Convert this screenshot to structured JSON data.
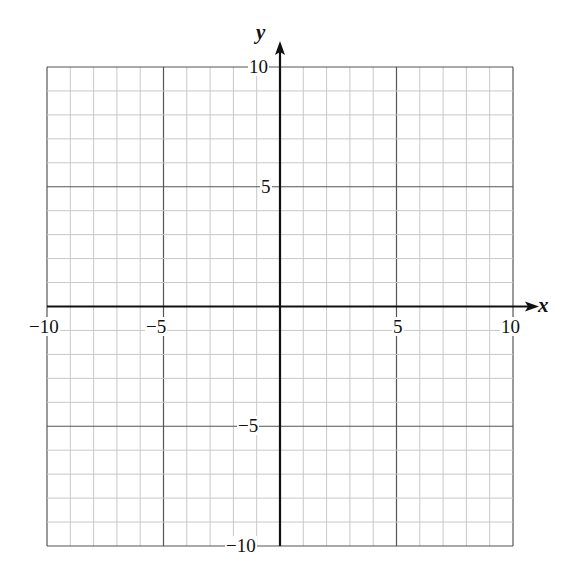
{
  "chart_data": {
    "type": "scatter",
    "title": "",
    "xlabel": "x",
    "ylabel": "y",
    "xlim": [
      -10,
      10
    ],
    "ylim": [
      -10,
      10
    ],
    "grid": true,
    "minor_grid_step": 1,
    "major_grid_step": 5,
    "x_ticks": [
      "−10",
      "−5",
      "5",
      "10"
    ],
    "y_ticks": [
      "10",
      "5",
      "−5",
      "−10"
    ],
    "series": [],
    "legend": null
  },
  "labels": {
    "x_axis": "x",
    "y_axis": "y",
    "xt_m10": "−10",
    "xt_m5": "−5",
    "xt_5": "5",
    "xt_10": "10",
    "yt_10": "10",
    "yt_5": "5",
    "yt_m5": "−5",
    "yt_m10": "−10"
  },
  "colors": {
    "minor_grid": "#c8c8c8",
    "major_grid": "#555555",
    "axis": "#111111"
  }
}
